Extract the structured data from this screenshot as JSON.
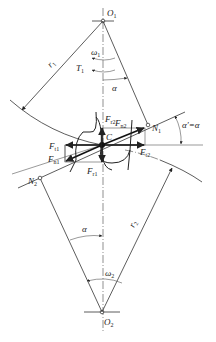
{
  "figure": {
    "labels": {
      "O1": {
        "main": "O",
        "sub": "1"
      },
      "O2": {
        "main": "O",
        "sub": "2"
      },
      "C": {
        "main": "C",
        "sub": ""
      },
      "N1": {
        "main": "N",
        "sub": "1"
      },
      "N2": {
        "main": "N",
        "sub": "2"
      },
      "r1": {
        "main": "r",
        "sub": "1"
      },
      "r2": {
        "main": "r",
        "sub": "2"
      },
      "omega1": {
        "main": "ω",
        "sub": "1"
      },
      "omega2": {
        "main": "ω",
        "sub": "2"
      },
      "T1": {
        "main": "T",
        "sub": "1"
      },
      "alpha_top": {
        "main": "α",
        "sub": ""
      },
      "alpha_bottom": {
        "main": "α",
        "sub": ""
      },
      "alpha_prime": {
        "main": "α′=α",
        "sub": ""
      },
      "Ft1": {
        "main": "F",
        "sub": "t1"
      },
      "Fn1": {
        "main": "F",
        "sub": "n1"
      },
      "Fr1": {
        "main": "F",
        "sub": "r1"
      },
      "Ft2": {
        "main": "F",
        "sub": "t2"
      },
      "Fn2": {
        "main": "F",
        "sub": "n2"
      },
      "Fr2": {
        "main": "F",
        "sub": "r2"
      }
    }
  }
}
